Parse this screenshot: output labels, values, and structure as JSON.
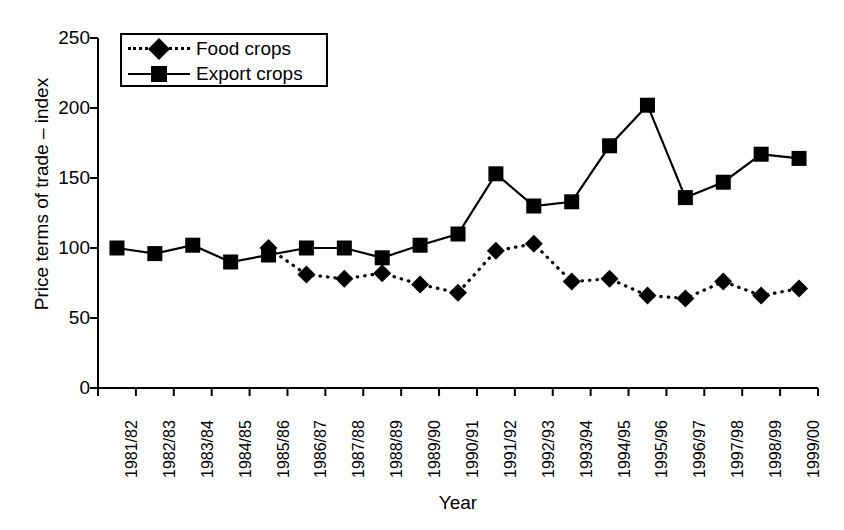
{
  "chart_data": {
    "type": "line",
    "title": "",
    "xlabel": "Year",
    "ylabel": "Price terms of trade – index",
    "ylim": [
      0,
      250
    ],
    "yticks": [
      0,
      50,
      100,
      150,
      200,
      250
    ],
    "grid": false,
    "legend_position": "top-left",
    "categories": [
      "1981/82",
      "1982/83",
      "1983/84",
      "1984/85",
      "1985/86",
      "1986/87",
      "1987/88",
      "1988/89",
      "1989/90",
      "1990/91",
      "1991/92",
      "1992/93",
      "1993/94",
      "1994/95",
      "1995/96",
      "1996/97",
      "1997/98",
      "1998/99",
      "1999/00"
    ],
    "series": [
      {
        "name": "Food crops",
        "marker": "diamond",
        "line_style": "dotted",
        "color": "#000000",
        "values": [
          null,
          null,
          null,
          null,
          100,
          81,
          78,
          82,
          74,
          68,
          98,
          103,
          76,
          78,
          66,
          64,
          76,
          66,
          71
        ]
      },
      {
        "name": "Export crops",
        "marker": "square",
        "line_style": "solid",
        "color": "#000000",
        "values": [
          100,
          96,
          102,
          90,
          95,
          100,
          100,
          93,
          102,
          110,
          153,
          130,
          133,
          173,
          202,
          136,
          147,
          167,
          164
        ]
      }
    ]
  },
  "legend": {
    "items": [
      {
        "label": "Food crops",
        "marker": "diamond-marker",
        "style": "dotted"
      },
      {
        "label": "Export crops",
        "marker": "square-marker",
        "style": "solid"
      }
    ]
  },
  "axes": {
    "y_title": "Price terms of trade – index",
    "x_title": "Year"
  },
  "colors": {
    "ink": "#000000",
    "background": "#ffffff"
  }
}
